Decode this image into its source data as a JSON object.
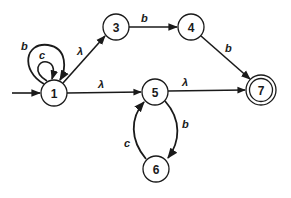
{
  "diagram": {
    "type": "finite-automaton",
    "colors": {
      "stroke": "#1a1a1a",
      "background": "#ffffff"
    },
    "start_state": "1",
    "accepting_states": [
      "7"
    ],
    "states": [
      {
        "id": "1",
        "label": "1",
        "cx": 54,
        "cy": 93
      },
      {
        "id": "3",
        "label": "3",
        "cx": 116,
        "cy": 27
      },
      {
        "id": "4",
        "label": "4",
        "cx": 191,
        "cy": 27
      },
      {
        "id": "5",
        "label": "5",
        "cx": 155,
        "cy": 92
      },
      {
        "id": "6",
        "label": "6",
        "cx": 156,
        "cy": 169
      },
      {
        "id": "7",
        "label": "7",
        "cx": 261,
        "cy": 90
      }
    ],
    "transitions": [
      {
        "from": "1",
        "to": "1",
        "label": "b"
      },
      {
        "from": "1",
        "to": "1",
        "label": "c"
      },
      {
        "from": "1",
        "to": "3",
        "label": "λ"
      },
      {
        "from": "3",
        "to": "4",
        "label": "b"
      },
      {
        "from": "4",
        "to": "7",
        "label": "b"
      },
      {
        "from": "1",
        "to": "5",
        "label": "λ"
      },
      {
        "from": "5",
        "to": "7",
        "label": "λ"
      },
      {
        "from": "5",
        "to": "6",
        "label": "b"
      },
      {
        "from": "6",
        "to": "5",
        "label": "c"
      }
    ]
  }
}
